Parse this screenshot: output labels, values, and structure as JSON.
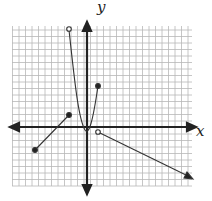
{
  "chart_data": {
    "type": "line",
    "title": "",
    "xlabel": "x",
    "ylabel": "y",
    "grid": true,
    "grid_spacing_px": 6.5,
    "origin_px": [
      87,
      127
    ],
    "xlim": [
      -12,
      16
    ],
    "ylim": [
      -10,
      15
    ],
    "series": [
      {
        "name": "left-segment",
        "kind": "segment",
        "points": [
          [
            -8,
            -3.5
          ],
          [
            -3,
            2
          ]
        ],
        "endpoints": [
          "closed",
          "closed"
        ]
      },
      {
        "name": "parabola",
        "kind": "curve",
        "points": [
          [
            -3,
            15
          ],
          [
            -2,
            7
          ],
          [
            -1,
            1.5
          ],
          [
            0,
            -0.5
          ],
          [
            1,
            1.5
          ],
          [
            2,
            6
          ]
        ],
        "endpoints": [
          "open",
          "closed"
        ]
      },
      {
        "name": "right-ray",
        "kind": "ray",
        "points": [
          [
            2,
            -1
          ],
          [
            16,
            -8
          ]
        ],
        "endpoints": [
          "open",
          "arrow"
        ]
      }
    ]
  },
  "labels": {
    "x_axis": "x",
    "y_axis": "y"
  },
  "colors": {
    "grid": "#b8b8b8",
    "axis": "#222222",
    "curve": "#333333"
  }
}
